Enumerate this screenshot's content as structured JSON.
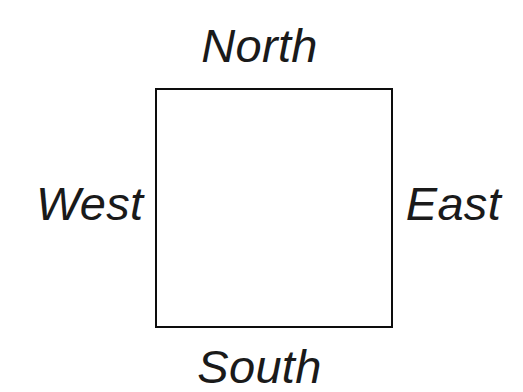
{
  "diagram": {
    "type": "labelled-square-diagram",
    "background_color": "#ffffff",
    "stroke_color": "#0d0d0d",
    "text_color": "#1a1a1a",
    "shape": {
      "name": "square",
      "x": 155,
      "y": 88,
      "width": 238,
      "height": 240,
      "stroke_width": 2,
      "fill": "#ffffff"
    },
    "labels": {
      "north": "North",
      "east": "East",
      "south": "South",
      "west": "West"
    }
  }
}
